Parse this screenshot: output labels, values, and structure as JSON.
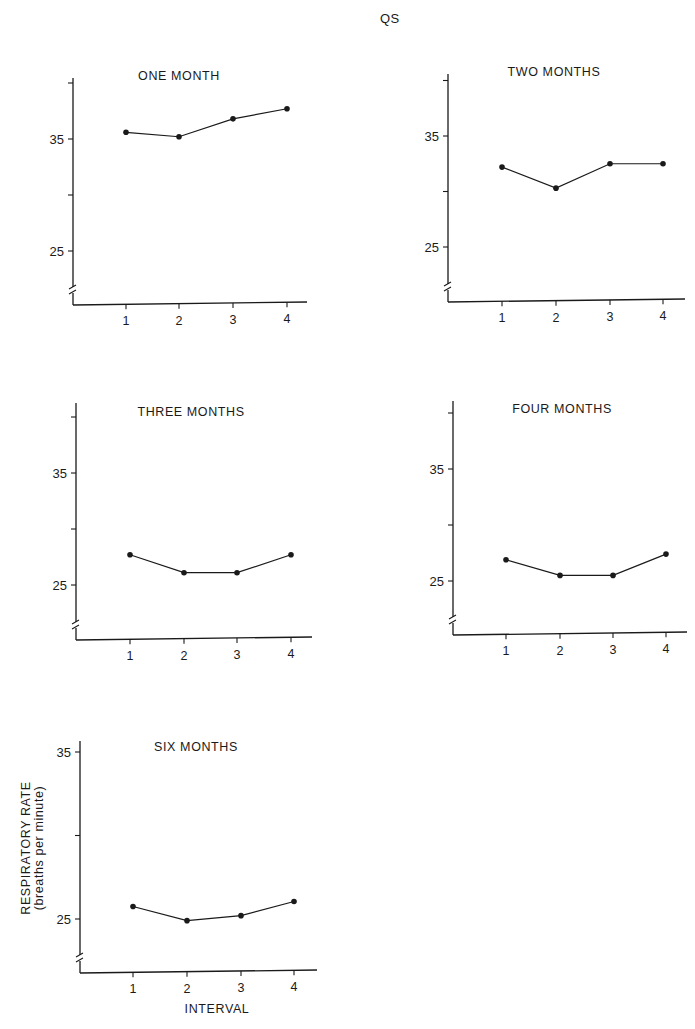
{
  "figure": {
    "title": "QS",
    "ylabel_line1": "RESPIRATORY  RATE",
    "ylabel_line2": "(breaths  per  minute)",
    "xlabel": "INTERVAL"
  },
  "chart_data": [
    {
      "type": "line",
      "title": "ONE  MONTH",
      "categories": [
        "1",
        "2",
        "3",
        "4"
      ],
      "values": [
        35.6,
        35.2,
        36.8,
        37.7
      ],
      "xlabel": "",
      "ylabel": "",
      "yticks": [
        25,
        30,
        35,
        40
      ],
      "ytick_labels": [
        "25",
        "",
        "35",
        ""
      ],
      "ylim": [
        21,
        41
      ],
      "axis_break": true,
      "grid": false
    },
    {
      "type": "line",
      "title": "TWO  MONTHS",
      "categories": [
        "1",
        "2",
        "3",
        "4"
      ],
      "values": [
        32.2,
        30.3,
        32.5,
        32.5
      ],
      "xlabel": "",
      "ylabel": "",
      "yticks": [
        25,
        30,
        35,
        40
      ],
      "ytick_labels": [
        "25",
        "",
        "35",
        ""
      ],
      "ylim": [
        21,
        41
      ],
      "axis_break": true,
      "grid": false
    },
    {
      "type": "line",
      "title": "THREE  MONTHS",
      "categories": [
        "1",
        "2",
        "3",
        "4"
      ],
      "values": [
        27.7,
        26.1,
        26.1,
        27.7
      ],
      "xlabel": "",
      "ylabel": "",
      "yticks": [
        25,
        30,
        35,
        40
      ],
      "ytick_labels": [
        "25",
        "",
        "35",
        ""
      ],
      "ylim": [
        21,
        41
      ],
      "axis_break": true,
      "grid": false
    },
    {
      "type": "line",
      "title": "FOUR  MONTHS",
      "categories": [
        "1",
        "2",
        "3",
        "4"
      ],
      "values": [
        26.9,
        25.5,
        25.5,
        27.4
      ],
      "xlabel": "",
      "ylabel": "",
      "yticks": [
        25,
        30,
        35,
        40
      ],
      "ytick_labels": [
        "25",
        "",
        "35",
        ""
      ],
      "ylim": [
        21,
        41
      ],
      "axis_break": true,
      "grid": false
    },
    {
      "type": "line",
      "title": "SIX  MONTHS",
      "categories": [
        "1",
        "2",
        "3",
        "4"
      ],
      "values": [
        25.75,
        24.9,
        25.2,
        26.05
      ],
      "xlabel": "INTERVAL",
      "ylabel": "RESPIRATORY RATE (breaths per minute)",
      "yticks": [
        25,
        30,
        35
      ],
      "ytick_labels": [
        "25",
        "",
        "35"
      ],
      "ylim": [
        22,
        35.7
      ],
      "axis_break": true,
      "grid": false
    }
  ]
}
